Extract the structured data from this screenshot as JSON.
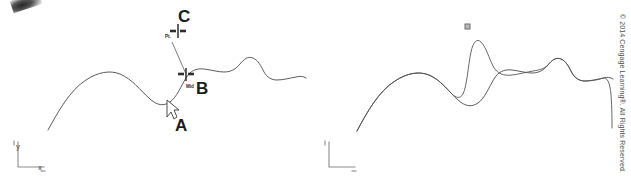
{
  "figure": {
    "title": "",
    "panels": [
      {
        "id": "left",
        "name": "spline-edit-before",
        "labels": {
          "a": "A",
          "b": "B",
          "c": "C"
        },
        "snap_markers": [
          {
            "name": "point-snap",
            "label": "Pt.",
            "x": 178,
            "y": 31
          },
          {
            "name": "midpoint-snap",
            "label": "Mid",
            "x": 186,
            "y": 74
          }
        ],
        "cursor": {
          "name": "arrow-cursor",
          "x": 168,
          "y": 104
        },
        "axis_icon": {
          "x_label": "x",
          "y_label": "y"
        }
      },
      {
        "id": "right",
        "name": "spline-edit-after",
        "labels": {},
        "grip": {
          "name": "control-point-grip",
          "x": 468,
          "y": 27
        },
        "axis_icon": {
          "x_label": "x",
          "y_label": "y"
        }
      }
    ]
  },
  "credit": {
    "text": "© 2014 Cengage Learning®. All Rights Reserved."
  },
  "colors": {
    "curve": "#4a4a4a",
    "curve_modified": "#565656",
    "axis": "#8b8b8b",
    "marker": "#2e2e2e",
    "grip_fill": "#b9b9b9",
    "background": "#ffffff"
  },
  "curve_geometry": {
    "left_original": "M 48 130 C 58 112, 70 90, 86 80 C 98 72, 110 70, 120 74 C 132 79, 140 90, 150 99 C 158 106, 164 106, 170 102 C 177 97, 181 86, 186 78 C 190 71, 196 68, 204 69 C 212 70, 218 72, 224 72 C 231 72, 236 69, 240 64 C 244 59, 248 56, 253 58 C 258 60, 261 66, 264 72 C 267 77, 271 80, 277 80 C 283 80, 290 78, 296 77 C 300 76, 303 76, 306 78",
    "right_original": "M 357 131 C 367 112, 379 91, 395 81 C 407 73, 419 71, 429 75 C 441 80, 448 91, 458 100 C 466 107, 472 107, 478 103 C 485 98, 489 87, 494 79 C 498 72, 504 69, 512 70 C 520 71, 526 73, 532 73 C 539 73, 544 70, 548 65 C 552 60, 556 57, 561 59 C 566 61, 569 67, 572 73 C 575 78, 579 81, 585 81 C 591 81, 598 79, 604 78 C 607 77, 610 77, 613 79",
    "right_modified": "M 357 131 C 367 112, 379 91, 395 81 C 407 73, 419 71, 429 75 C 440 80, 446 88, 452 94 C 456 98, 460 99, 463 94 C 467 86, 468 66, 471 52 C 473 42, 477 38, 481 42 C 486 47, 489 58, 493 66 C 497 74, 504 76, 512 75 C 520 74, 527 72, 533 71 C 539 70, 544 69, 548 65 C 552 60, 556 57, 561 59 C 566 61, 569 67, 572 73 C 575 78, 579 81, 585 81 C 591 81, 598 80, 603 78 C 607 77, 610 82, 611 95 C 612 108, 612 120, 612 128"
  }
}
